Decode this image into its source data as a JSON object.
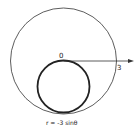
{
  "diagram": {
    "type": "polar-curve-sketch",
    "colors": {
      "stroke": "#333333",
      "background": "#ffffff"
    },
    "outer_circle": {
      "cx": 63.5,
      "cy": 61,
      "r": 53,
      "stroke_width": 0.8
    },
    "inner_circle": {
      "cx": 63.5,
      "cy": 86.5,
      "r": 26,
      "stroke_width": 1.8
    },
    "polar_axis": {
      "x1": 63.5,
      "y1": 61,
      "x2": 133,
      "y2": 61
    },
    "labels": {
      "origin": "0",
      "axis_value": "3",
      "equation": "r = -3 sinθ"
    }
  }
}
